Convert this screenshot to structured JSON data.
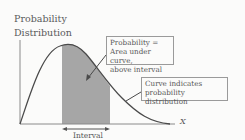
{
  "diagram": {
    "y_axis_label_line1": "Probability",
    "y_axis_label_line2": "Distribution",
    "x_axis_label": "X",
    "interval_label": "Interval",
    "callout_area": {
      "line1": "Probability =",
      "line2": "Area under curve,",
      "line3": "above interval"
    },
    "callout_curve": {
      "line1": "Curve indicates",
      "line2": "probability distribution"
    },
    "colors": {
      "curve": "#4a4a4a",
      "shaded_area": "#a6a6a6",
      "axis": "#8a8a8a",
      "background": "#fbfbfa"
    }
  }
}
